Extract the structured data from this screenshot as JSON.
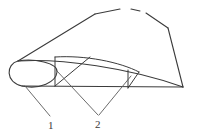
{
  "figure": {
    "kind": "technical-line-drawing",
    "canvas": {
      "width": 201,
      "height": 138
    },
    "stroke_color": "#3b3b3b",
    "background_color": "#ffffff",
    "stroke_width": 1.1,
    "callouts": [
      {
        "id": "callout-1",
        "label": "1",
        "label_x": 48,
        "label_y": 120,
        "leaders": [
          {
            "x1": 25,
            "y1": 86,
            "x2": 50,
            "y2": 116
          }
        ]
      },
      {
        "id": "callout-2",
        "label": "2",
        "label_x": 95,
        "label_y": 119,
        "leaders": [
          {
            "x1": 57,
            "y1": 71,
            "x2": 98,
            "y2": 115
          },
          {
            "x1": 131,
            "y1": 76,
            "x2": 99,
            "y2": 115
          }
        ]
      }
    ],
    "outline_paths": {
      "upper_ridge_left": "M 18 61 L 95 14",
      "upper_ridge_crest": "M 95 14 L 120 9",
      "upper_ridge_gap_segment": "M 131 9 L 140 11",
      "upper_ridge_right": "M 146 13 L 168 28",
      "right_edge": "M 168 28 L 183 87",
      "body_lower_curve": "M 18 61 C 60 58 130 68 183 87",
      "chord_baseline": "M 22 86 L 183 87",
      "nose_ellipse": "M 18 61 C 6 64 5 82 22 86 C 40 90 56 82 57 72 C 58 63 34 58 18 61 Z"
    },
    "inner_lines": {
      "rib_left_vertical": "M 55 57 L 55 86",
      "rib_right_vertical": "M 128 70 L 128 88",
      "diagonal_left": "M 55 86 L 90 57",
      "diagonal_right": "M 128 88 L 139 72",
      "upper_arc": "M 55 57 C 85 55 120 62 139 72"
    }
  }
}
